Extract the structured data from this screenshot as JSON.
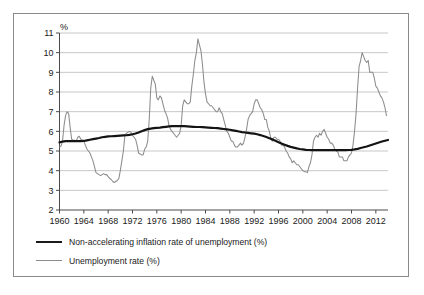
{
  "chart_data": {
    "type": "line",
    "title": "",
    "subtitle": "",
    "xlabel": "",
    "ylabel": "",
    "unit_label": "%",
    "grid": true,
    "legend_position": "bottom-left",
    "xlim": [
      1960,
      2014
    ],
    "ylim": [
      2,
      11
    ],
    "ytick_labels": [
      "11",
      "10",
      "9",
      "8",
      "7",
      "6",
      "5",
      "4",
      "3",
      "2"
    ],
    "yticks": [
      11,
      10,
      9,
      8,
      7,
      6,
      5,
      4,
      3,
      2
    ],
    "xtick_labels": [
      "1960",
      "1964",
      "1968",
      "1972",
      "1976",
      "1980",
      "1984",
      "1988",
      "1992",
      "1996",
      "2000",
      "2004",
      "2008",
      "2012"
    ],
    "xticks": [
      1960,
      1964,
      1968,
      1972,
      1976,
      1980,
      1984,
      1988,
      1992,
      1996,
      2000,
      2004,
      2008,
      2012
    ],
    "series": [
      {
        "name": "Non-accelerating inflation rate of unemployment (%)",
        "color": "#141414",
        "width": "thick",
        "x": [
          1960.0,
          1960.5,
          1961.0,
          1961.5,
          1962.0,
          1962.5,
          1963.0,
          1963.5,
          1964.0,
          1964.5,
          1965.0,
          1965.5,
          1966.0,
          1966.5,
          1967.0,
          1967.5,
          1968.0,
          1968.5,
          1969.0,
          1969.5,
          1970.0,
          1970.5,
          1971.0,
          1971.5,
          1972.0,
          1972.5,
          1973.0,
          1973.5,
          1974.0,
          1974.5,
          1975.0,
          1975.5,
          1976.0,
          1976.5,
          1977.0,
          1977.5,
          1978.0,
          1978.5,
          1979.0,
          1979.5,
          1980.0,
          1980.5,
          1981.0,
          1981.5,
          1982.0,
          1982.5,
          1983.0,
          1983.5,
          1984.0,
          1984.5,
          1985.0,
          1985.5,
          1986.0,
          1986.5,
          1987.0,
          1987.5,
          1988.0,
          1988.5,
          1989.0,
          1989.5,
          1990.0,
          1990.5,
          1991.0,
          1991.5,
          1992.0,
          1992.5,
          1993.0,
          1993.5,
          1994.0,
          1994.5,
          1995.0,
          1995.5,
          1996.0,
          1996.5,
          1997.0,
          1997.5,
          1998.0,
          1998.5,
          1999.0,
          1999.5,
          2000.0,
          2000.5,
          2001.0,
          2001.5,
          2002.0,
          2002.5,
          2003.0,
          2003.5,
          2004.0,
          2004.5,
          2005.0,
          2005.5,
          2006.0,
          2006.5,
          2007.0,
          2007.5,
          2008.0,
          2008.5,
          2009.0,
          2009.5,
          2010.0,
          2010.5,
          2011.0,
          2011.5,
          2012.0,
          2012.5,
          2013.0,
          2013.5,
          2014.0
        ],
        "values": [
          5.44,
          5.48,
          5.5,
          5.5,
          5.5,
          5.5,
          5.5,
          5.5,
          5.51,
          5.54,
          5.57,
          5.6,
          5.63,
          5.66,
          5.7,
          5.72,
          5.74,
          5.75,
          5.76,
          5.77,
          5.78,
          5.79,
          5.8,
          5.82,
          5.85,
          5.89,
          5.94,
          6.0,
          6.06,
          6.11,
          6.14,
          6.16,
          6.18,
          6.19,
          6.21,
          6.23,
          6.25,
          6.26,
          6.26,
          6.26,
          6.26,
          6.26,
          6.25,
          6.24,
          6.23,
          6.22,
          6.22,
          6.21,
          6.2,
          6.19,
          6.18,
          6.17,
          6.16,
          6.14,
          6.12,
          6.1,
          6.08,
          6.05,
          6.02,
          5.99,
          5.96,
          5.94,
          5.92,
          5.9,
          5.88,
          5.85,
          5.81,
          5.76,
          5.71,
          5.65,
          5.59,
          5.52,
          5.45,
          5.38,
          5.32,
          5.26,
          5.21,
          5.17,
          5.13,
          5.1,
          5.08,
          5.06,
          5.05,
          5.04,
          5.04,
          5.04,
          5.04,
          5.04,
          5.04,
          5.04,
          5.04,
          5.04,
          5.04,
          5.04,
          5.04,
          5.05,
          5.06,
          5.08,
          5.11,
          5.15,
          5.19,
          5.23,
          5.28,
          5.33,
          5.38,
          5.43,
          5.48,
          5.52,
          5.56
        ]
      },
      {
        "name": "Unemployment rate (%)",
        "color": "#8c8c8c",
        "width": "thin",
        "x": [
          1960.0,
          1960.25,
          1960.5,
          1960.75,
          1961.0,
          1961.25,
          1961.5,
          1961.75,
          1962.0,
          1962.25,
          1962.5,
          1962.75,
          1963.0,
          1963.25,
          1963.5,
          1963.75,
          1964.0,
          1964.25,
          1964.5,
          1964.75,
          1965.0,
          1965.25,
          1965.5,
          1965.75,
          1966.0,
          1966.25,
          1966.5,
          1966.75,
          1967.0,
          1967.25,
          1967.5,
          1967.75,
          1968.0,
          1968.25,
          1968.5,
          1968.75,
          1969.0,
          1969.25,
          1969.5,
          1969.75,
          1970.0,
          1970.25,
          1970.5,
          1970.75,
          1971.0,
          1971.25,
          1971.5,
          1971.75,
          1972.0,
          1972.25,
          1972.5,
          1972.75,
          1973.0,
          1973.25,
          1973.5,
          1973.75,
          1974.0,
          1974.25,
          1974.5,
          1974.75,
          1975.0,
          1975.25,
          1975.5,
          1975.75,
          1976.0,
          1976.25,
          1976.5,
          1976.75,
          1977.0,
          1977.25,
          1977.5,
          1977.75,
          1978.0,
          1978.25,
          1978.5,
          1978.75,
          1979.0,
          1979.25,
          1979.5,
          1979.75,
          1980.0,
          1980.25,
          1980.5,
          1980.75,
          1981.0,
          1981.25,
          1981.5,
          1981.75,
          1982.0,
          1982.25,
          1982.5,
          1982.75,
          1983.0,
          1983.25,
          1983.5,
          1983.75,
          1984.0,
          1984.25,
          1984.5,
          1984.75,
          1985.0,
          1985.25,
          1985.5,
          1985.75,
          1986.0,
          1986.25,
          1986.5,
          1986.75,
          1987.0,
          1987.25,
          1987.5,
          1987.75,
          1988.0,
          1988.25,
          1988.5,
          1988.75,
          1989.0,
          1989.25,
          1989.5,
          1989.75,
          1990.0,
          1990.25,
          1990.5,
          1990.75,
          1991.0,
          1991.25,
          1991.5,
          1991.75,
          1992.0,
          1992.25,
          1992.5,
          1992.75,
          1993.0,
          1993.25,
          1993.5,
          1993.75,
          1994.0,
          1994.25,
          1994.5,
          1994.75,
          1995.0,
          1995.25,
          1995.5,
          1995.75,
          1996.0,
          1996.25,
          1996.5,
          1996.75,
          1997.0,
          1997.25,
          1997.5,
          1997.75,
          1998.0,
          1998.25,
          1998.5,
          1998.75,
          1999.0,
          1999.25,
          1999.5,
          1999.75,
          2000.0,
          2000.25,
          2000.5,
          2000.75,
          2001.0,
          2001.25,
          2001.5,
          2001.75,
          2002.0,
          2002.25,
          2002.5,
          2002.75,
          2003.0,
          2003.25,
          2003.5,
          2003.75,
          2004.0,
          2004.25,
          2004.5,
          2004.75,
          2005.0,
          2005.25,
          2005.5,
          2005.75,
          2006.0,
          2006.25,
          2006.5,
          2006.75,
          2007.0,
          2007.25,
          2007.5,
          2007.75,
          2008.0,
          2008.25,
          2008.5,
          2008.75,
          2009.0,
          2009.25,
          2009.5,
          2009.75,
          2010.0,
          2010.25,
          2010.5,
          2010.75,
          2011.0,
          2011.25,
          2011.5,
          2011.75,
          2012.0,
          2012.25,
          2012.5,
          2012.75,
          2013.0,
          2013.25,
          2013.5,
          2013.75
        ],
        "values": [
          5.2,
          5.25,
          5.5,
          6.3,
          6.8,
          7.0,
          6.9,
          6.2,
          5.6,
          5.55,
          5.55,
          5.5,
          5.7,
          5.75,
          5.6,
          5.55,
          5.5,
          5.3,
          5.1,
          5.0,
          4.9,
          4.7,
          4.5,
          4.2,
          3.9,
          3.85,
          3.8,
          3.75,
          3.8,
          3.85,
          3.8,
          3.8,
          3.7,
          3.6,
          3.55,
          3.45,
          3.4,
          3.45,
          3.5,
          3.6,
          4.0,
          4.5,
          5.0,
          5.8,
          5.9,
          5.95,
          6.0,
          5.95,
          5.8,
          5.7,
          5.6,
          5.3,
          4.9,
          4.85,
          4.8,
          4.8,
          5.1,
          5.2,
          5.5,
          6.6,
          8.2,
          8.8,
          8.6,
          8.4,
          7.7,
          7.6,
          7.8,
          7.7,
          7.4,
          7.1,
          6.9,
          6.7,
          6.3,
          6.1,
          6.0,
          5.9,
          5.8,
          5.7,
          5.8,
          5.9,
          6.3,
          7.3,
          7.6,
          7.5,
          7.4,
          7.4,
          7.5,
          8.3,
          8.9,
          9.6,
          10.0,
          10.7,
          10.4,
          10.1,
          9.4,
          8.5,
          7.9,
          7.5,
          7.4,
          7.3,
          7.3,
          7.2,
          7.1,
          7.0,
          7.0,
          7.2,
          7.0,
          6.9,
          6.6,
          6.3,
          6.0,
          5.9,
          5.7,
          5.5,
          5.5,
          5.3,
          5.2,
          5.2,
          5.3,
          5.4,
          5.3,
          5.4,
          5.7,
          6.1,
          6.6,
          6.8,
          6.9,
          7.0,
          7.4,
          7.6,
          7.6,
          7.4,
          7.2,
          7.1,
          6.9,
          6.6,
          6.6,
          6.2,
          6.0,
          5.6,
          5.5,
          5.7,
          5.7,
          5.6,
          5.6,
          5.5,
          5.3,
          5.3,
          5.2,
          5.0,
          4.9,
          4.7,
          4.6,
          4.4,
          4.5,
          4.4,
          4.3,
          4.3,
          4.2,
          4.1,
          4.0,
          3.95,
          3.95,
          3.9,
          4.2,
          4.4,
          4.8,
          5.5,
          5.7,
          5.8,
          5.7,
          5.9,
          5.8,
          6.0,
          6.1,
          5.9,
          5.7,
          5.6,
          5.4,
          5.4,
          5.3,
          5.1,
          5.0,
          4.95,
          4.7,
          4.7,
          4.7,
          4.5,
          4.5,
          4.5,
          4.7,
          4.8,
          4.9,
          5.3,
          6.0,
          6.9,
          8.2,
          9.3,
          9.6,
          10.0,
          9.8,
          9.6,
          9.5,
          9.6,
          9.0,
          9.0,
          9.0,
          8.7,
          8.3,
          8.2,
          8.0,
          7.8,
          7.7,
          7.5,
          7.2,
          6.8
        ]
      }
    ]
  },
  "legend": {
    "items": [
      {
        "label": "Non-accelerating inflation rate of unemployment (%)",
        "style": "thick"
      },
      {
        "label": "Unemployment rate (%)",
        "style": "thin"
      }
    ]
  },
  "colors": {
    "nairu": "#141414",
    "unemployment": "#8c8c8c",
    "grid": "#b9b9b9",
    "axis": "#4a4a4a",
    "border": "#8a8a8a",
    "text": "#1a1a1a",
    "background": "#ffffff"
  }
}
